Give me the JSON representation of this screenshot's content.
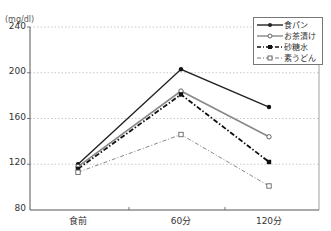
{
  "chart_data": {
    "type": "line",
    "title": "",
    "xlabel": "",
    "ylabel": "(mg/dl)",
    "categories": [
      "食前",
      "60分",
      "120分"
    ],
    "ylim": [
      80,
      240
    ],
    "yticks": [
      80,
      120,
      160,
      200,
      240
    ],
    "grid": "horizontal dotted",
    "legend_position": "upper right",
    "series": [
      {
        "name": "食パン",
        "values": [
          120,
          203,
          170
        ],
        "style": "solid",
        "marker": "filled-circle",
        "color": "#222222"
      },
      {
        "name": "お茶漬け",
        "values": [
          118,
          184,
          144
        ],
        "style": "solid-gray",
        "marker": "open-circle",
        "color": "#888888"
      },
      {
        "name": "砂糖水",
        "values": [
          116,
          181,
          122
        ],
        "style": "dash-dot",
        "marker": "filled-square",
        "color": "#111111"
      },
      {
        "name": "素うどん",
        "values": [
          113,
          146,
          101
        ],
        "style": "dash-dot-light",
        "marker": "open-square",
        "color": "#777777"
      }
    ]
  },
  "axis": {
    "unit": "(mg/dl)",
    "yticks": [
      "240",
      "200",
      "160",
      "120",
      "80"
    ],
    "xticks": [
      "食前",
      "60分",
      "120分"
    ]
  },
  "legend": [
    "食パン",
    "お茶漬け",
    "砂糖水",
    "素うどん"
  ]
}
